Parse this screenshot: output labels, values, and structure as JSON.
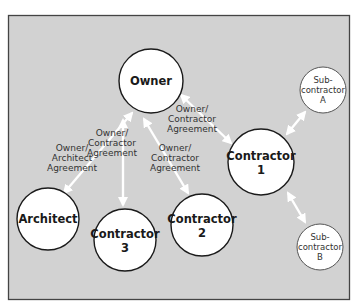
{
  "diagram": {
    "type": "relationship-diagram",
    "colors": {
      "background": "#d2d2d2",
      "frame": "#444444",
      "node_fill": "#ffffff",
      "node_stroke": "#1a1a1a",
      "sub_node_stroke": "#555555",
      "arrow": "#ffffff",
      "text": "#1a1a1a",
      "edge_text": "#333333"
    },
    "nodes": [
      {
        "id": "owner",
        "lines": [
          "Owner"
        ],
        "cx": 151,
        "cy": 81,
        "r": 32,
        "style": "bold"
      },
      {
        "id": "architect",
        "lines": [
          "Architect"
        ],
        "cx": 48,
        "cy": 219,
        "r": 31,
        "style": "bold"
      },
      {
        "id": "contractor3",
        "lines": [
          "Contractor",
          "3"
        ],
        "cx": 125,
        "cy": 240,
        "r": 31,
        "style": "bold"
      },
      {
        "id": "contractor2",
        "lines": [
          "Contractor",
          "2"
        ],
        "cx": 202,
        "cy": 225,
        "r": 31,
        "style": "bold"
      },
      {
        "id": "contractor1",
        "lines": [
          "Contractor",
          "1"
        ],
        "cx": 261,
        "cy": 162,
        "r": 33,
        "style": "bold"
      },
      {
        "id": "subA",
        "lines": [
          "Sub-",
          "contractor",
          "A"
        ],
        "cx": 323,
        "cy": 90,
        "r": 23,
        "style": "light"
      },
      {
        "id": "subB",
        "lines": [
          "Sub-",
          "contractor",
          "B"
        ],
        "cx": 320,
        "cy": 247,
        "r": 23,
        "style": "light"
      }
    ],
    "edges": [
      {
        "from": "owner",
        "to": "architect",
        "label": [
          "Owner/",
          "Architect",
          "Agreement"
        ],
        "bidirectional": true
      },
      {
        "from": "owner",
        "to": "contractor3",
        "label": [
          "Owner/",
          "Contractor",
          "Agreement"
        ],
        "bidirectional": true
      },
      {
        "from": "owner",
        "to": "contractor2",
        "label": [
          "Owner/",
          "Contractor",
          "Agreement"
        ],
        "bidirectional": true
      },
      {
        "from": "owner",
        "to": "contractor1",
        "label": [
          "Owner/",
          "Contractor",
          "Agreement"
        ],
        "bidirectional": true
      },
      {
        "from": "contractor1",
        "to": "subA",
        "label": [],
        "bidirectional": true
      },
      {
        "from": "contractor1",
        "to": "subB",
        "label": [],
        "bidirectional": true
      }
    ],
    "labels": {
      "owner": "Owner",
      "architect": "Architect",
      "contractor": "Contractor",
      "contractor1_num": "1",
      "contractor2_num": "2",
      "contractor3_num": "3",
      "sub_prefix": "Sub-",
      "sub_body": "contractor",
      "subA_letter": "A",
      "subB_letter": "B",
      "edge_owner_slash": "Owner/",
      "edge_architect": "Architect",
      "edge_contractor": "Contractor",
      "edge_agreement": "Agreement"
    }
  }
}
